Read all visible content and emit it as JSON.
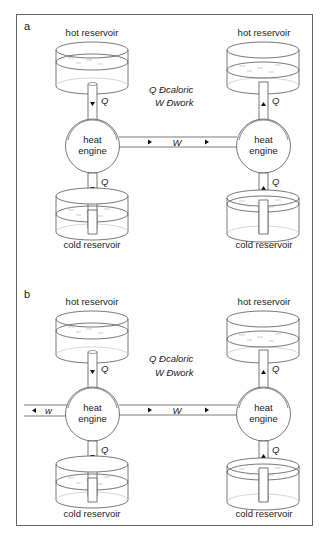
{
  "figure": {
    "panels": [
      {
        "letter": "a",
        "left": {
          "hot": "hot reservoir",
          "cold": "cold reservoir",
          "engine_line1": "heat",
          "engine_line2": "engine",
          "q_top": "Q",
          "q_bottom": "Q",
          "flow": "down"
        },
        "right": {
          "hot": "hot reservoir",
          "cold": "cold reservoir",
          "engine_line1": "heat",
          "engine_line2": "engine",
          "q_top": "Q",
          "q_bottom": "Q",
          "flow": "up"
        },
        "work_label": "W",
        "legend": {
          "line1": "Q Ðcaloric",
          "line2": "W Ðwork"
        }
      },
      {
        "letter": "b",
        "left": {
          "hot": "hot reservoir",
          "cold": "cold reservoir",
          "engine_line1": "heat",
          "engine_line2": "engine",
          "q_top": "Q",
          "q_bottom": "Q",
          "flow": "down"
        },
        "right": {
          "hot": "hot reservoir",
          "cold": "cold reservoir",
          "engine_line1": "heat",
          "engine_line2": "engine",
          "q_top": "Q",
          "q_bottom": "Q",
          "flow": "up"
        },
        "work_label": "W",
        "extra_work_label": "w",
        "legend": {
          "line1": "Q Ðcaloric",
          "line2": "W Ðwork"
        }
      }
    ]
  }
}
